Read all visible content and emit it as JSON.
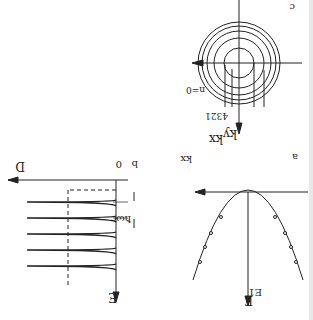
{
  "figure": {
    "orientation": "rotated 180 degrees",
    "panel_a": {
      "label": "a",
      "x_axis": "kx",
      "y_axis": "E",
      "curve_label": "E1",
      "description": "Inverted parabola (dispersion) with discrete points"
    },
    "panel_b": {
      "label": "b",
      "x_axis": "D",
      "y_axis": "E",
      "origin": "0",
      "spacing_label": "ħωc",
      "peaks": 5,
      "description": "Density of states with Landau level peaks"
    },
    "panel_c": {
      "label": "c",
      "x_axis": "kx",
      "y_axis": "ky",
      "center_label": "n=0",
      "ring_labels": [
        "1",
        "2",
        "3",
        "4"
      ],
      "description": "Concentric circles in k-space"
    }
  }
}
